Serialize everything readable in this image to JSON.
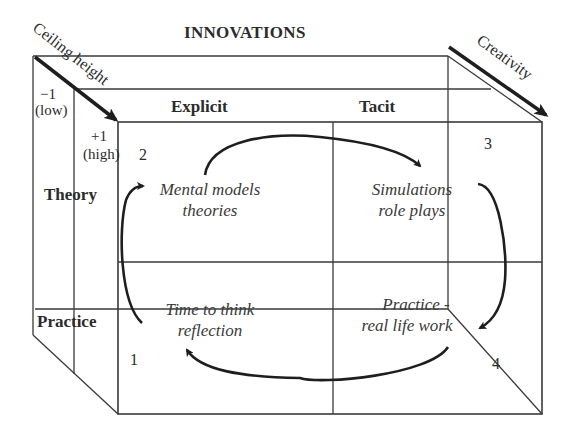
{
  "diagram": {
    "title": "INNOVATIONS",
    "axes": {
      "ceiling_height": {
        "label": "Ceiling height",
        "low_value": "−1",
        "low_label": "(low)",
        "high_value": "+1",
        "high_label": "(high)"
      },
      "creativity": {
        "label": "Creativity"
      }
    },
    "columns": [
      "Explicit",
      "Tacit"
    ],
    "rows": [
      "Theory",
      "Practice"
    ],
    "cells": [
      {
        "id": "mental-models",
        "line1": "Mental models",
        "line2": "theories"
      },
      {
        "id": "simulations",
        "line1": "Simulations",
        "line2": "role plays"
      },
      {
        "id": "time-to-think",
        "line1": "Time to think",
        "line2": "reflection"
      },
      {
        "id": "practice-real-life",
        "line1": "Practice -",
        "line2": "real life work"
      }
    ],
    "corner_numbers": [
      "1",
      "2",
      "3",
      "4"
    ],
    "cycle_arrows": [
      {
        "from": "Mental models theories",
        "to": "Simulations role plays"
      },
      {
        "from": "Simulations role plays",
        "to": "Practice - real life work"
      },
      {
        "from": "Practice - real life work",
        "to": "Time to think reflection"
      },
      {
        "from": "Time to think reflection",
        "to": "Mental models theories"
      }
    ],
    "colors": {
      "line": "#3a3a3a",
      "arrow": "#1e1e1e",
      "text": "#2b2b2b"
    }
  }
}
